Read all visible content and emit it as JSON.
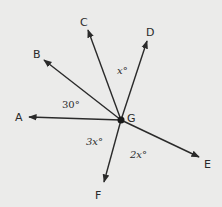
{
  "diagram": {
    "center": {
      "label": "G"
    },
    "rays": [
      {
        "id": "A",
        "label": "A"
      },
      {
        "id": "B",
        "label": "B"
      },
      {
        "id": "C",
        "label": "C"
      },
      {
        "id": "D",
        "label": "D"
      },
      {
        "id": "E",
        "label": "E"
      },
      {
        "id": "F",
        "label": "F"
      }
    ],
    "angles": [
      {
        "between": "A-B",
        "label": "30°"
      },
      {
        "between": "C-D",
        "label": "x°"
      },
      {
        "between": "A-F",
        "label": "3x°"
      },
      {
        "between": "F-E",
        "label": "2x°"
      }
    ],
    "colors": {
      "line": "#2a2a2a",
      "background": "#ebebea"
    }
  }
}
